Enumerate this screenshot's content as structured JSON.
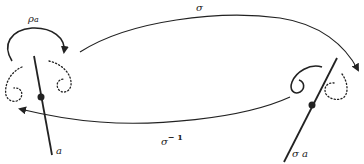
{
  "diagram": {
    "labels": {
      "rho_a": "ρ",
      "rho_a_sub": "a",
      "sigma": "σ",
      "sigma_inverse": "σ",
      "sigma_inverse_exp": "− 1",
      "line_a": "a",
      "line_sigma_a": "σ a"
    },
    "colors": {
      "stroke": "#222222",
      "background": "#ffffff"
    }
  }
}
